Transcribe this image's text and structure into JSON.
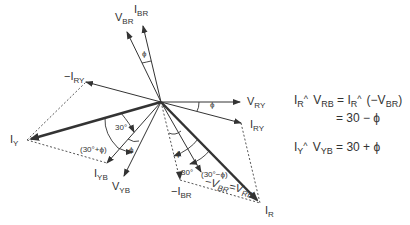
{
  "diagram": {
    "type": "phasor-diagram",
    "origin": [
      161,
      102
    ],
    "phasors": [
      {
        "id": "V_BR",
        "label_main": "V",
        "label_sub": "BR",
        "tip": [
          127,
          32
        ],
        "style": "thin"
      },
      {
        "id": "I_BR",
        "label_main": "I",
        "label_sub": "BR",
        "tip": [
          143,
          26
        ],
        "style": "thin"
      },
      {
        "id": "-I_RY",
        "label_main": "−I",
        "label_sub": "RY",
        "tip": [
          86,
          82
        ],
        "style": "thin"
      },
      {
        "id": "V_RY",
        "label_main": "V",
        "label_sub": "RY",
        "tip": [
          240,
          102
        ],
        "style": "thin"
      },
      {
        "id": "I_RY",
        "label_main": "I",
        "label_sub": "RY",
        "tip": [
          241,
          123
        ],
        "style": "thin"
      },
      {
        "id": "I_Y",
        "label_main": "I",
        "label_sub": "Y",
        "tip": [
          27,
          140
        ],
        "style": "thick"
      },
      {
        "id": "I_YB",
        "label_main": "I",
        "label_sub": "YB",
        "tip": [
          107,
          163
        ],
        "style": "thin"
      },
      {
        "id": "V_YB",
        "label_main": "V",
        "label_sub": "YB",
        "tip": [
          124,
          176
        ],
        "style": "thin"
      },
      {
        "id": "-I_BR",
        "label_main": "−I",
        "label_sub": "BR",
        "tip": [
          180,
          180
        ],
        "style": "dotted"
      },
      {
        "id": "V_RB",
        "label_main": "−V",
        "label_sub": "BR",
        "label2_main": "=V",
        "label2_sub": "RB",
        "tip": [
          201,
          172
        ],
        "style": "thin"
      },
      {
        "id": "I_R",
        "label_main": "I",
        "label_sub": "R",
        "tip": [
          260,
          203
        ],
        "style": "thick"
      }
    ],
    "angle_labels": {
      "phi": "ϕ",
      "thirty": "30°",
      "thirty_plus_phi": "(30°+ϕ)",
      "thirty_minus_phi": "(30°−ϕ)"
    }
  },
  "equations": {
    "line1": {
      "a": "I",
      "a_sub": "R",
      "b": "V",
      "b_sub": "RB",
      "eq": "=",
      "c": "I",
      "c_sub": "R",
      "d": "(−V",
      "d_sub": "BR",
      "d_close": ")"
    },
    "line2": {
      "text": "= 30 − ϕ"
    },
    "line3": {
      "a": "I",
      "a_sub": "Y",
      "b": "V",
      "b_sub": "YB",
      "rest": "= 30 + ϕ"
    }
  }
}
